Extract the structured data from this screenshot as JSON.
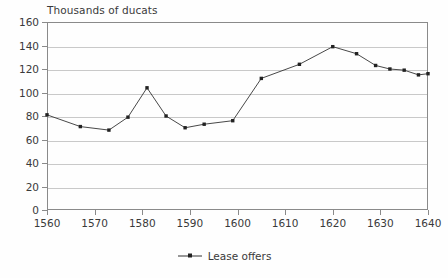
{
  "chart_data": {
    "type": "line",
    "title": "Thousands of ducats",
    "xlabel": "",
    "ylabel": "Thousands of ducats",
    "xlim": [
      1560,
      1640
    ],
    "ylim": [
      0,
      160
    ],
    "grid": true,
    "legend_position": "bottom-center",
    "xticks": [
      1560,
      1570,
      1580,
      1590,
      1600,
      1610,
      1620,
      1630,
      1640
    ],
    "xtick_labels": [
      "1560",
      "1570",
      "1580",
      "1590",
      "1600",
      "1610",
      "1620",
      "1630",
      "1640"
    ],
    "yticks": [
      0,
      20,
      40,
      60,
      80,
      100,
      120,
      140,
      160
    ],
    "ytick_labels": [
      "0",
      "20",
      "40",
      "60",
      "80",
      "100",
      "120",
      "140",
      "160"
    ],
    "series": [
      {
        "name": "Lease offers",
        "color": "#333333",
        "marker": "square",
        "x": [
          1560,
          1567,
          1573,
          1577,
          1581,
          1585,
          1589,
          1593,
          1599,
          1605,
          1613,
          1620,
          1625,
          1629,
          1632,
          1635,
          1638,
          1640
        ],
        "values": [
          81,
          71,
          68,
          79,
          104,
          80,
          70,
          73,
          76,
          112,
          124,
          139,
          133,
          123,
          120,
          119,
          115,
          116
        ]
      }
    ]
  },
  "legend": {
    "entries": [
      {
        "label": "Lease offers"
      }
    ]
  }
}
